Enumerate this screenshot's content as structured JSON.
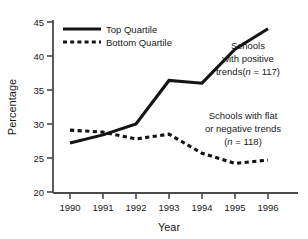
{
  "chart_data": {
    "type": "line",
    "title": "",
    "xlabel": "Year",
    "ylabel": "Percentage",
    "categories": [
      "1990",
      "1991",
      "1992",
      "1993",
      "1994",
      "1995",
      "1996"
    ],
    "x": [
      1990,
      1991,
      1992,
      1993,
      1994,
      1995,
      1996
    ],
    "xlim": [
      1989.5,
      1996.5
    ],
    "ylim": [
      20,
      45
    ],
    "yticks": [
      20,
      25,
      30,
      35,
      40,
      45
    ],
    "xticks": [
      "1990",
      "1991",
      "1992",
      "1993",
      "1994",
      "1995",
      "1996"
    ],
    "grid": false,
    "legend_position": "top-left",
    "series": [
      {
        "name": "Top Quartile",
        "style": "solid",
        "color": "#141414",
        "values": [
          27.2,
          28.4,
          30.0,
          36.4,
          36.0,
          41.0,
          44.0
        ]
      },
      {
        "name": "Bottom Quartile",
        "style": "dashed",
        "color": "#141414",
        "values": [
          29.1,
          28.8,
          27.8,
          28.5,
          25.7,
          24.2,
          24.7
        ]
      }
    ],
    "annotations": [
      {
        "id": "positive-trends",
        "lines": [
          "Schools",
          "with positive",
          "trends(n = 117)"
        ],
        "n_label": "n = 117"
      },
      {
        "id": "flat-negative-trends",
        "lines": [
          "Schools with flat",
          "or negative trends",
          "(n = 118)"
        ],
        "n_label": "n = 118"
      }
    ]
  },
  "axes": {
    "y_title": "Percentage",
    "x_title": "Year",
    "y_tick_labels": [
      "45",
      "40",
      "35",
      "30",
      "25",
      "20"
    ],
    "x_tick_labels": [
      "1990",
      "1991",
      "1992",
      "1993",
      "1994",
      "1995",
      "1996"
    ]
  },
  "legend": {
    "items": [
      {
        "label": "Top Quartile",
        "style": "solid"
      },
      {
        "label": "Bottom Quartile",
        "style": "dashed"
      }
    ]
  },
  "annotation_top": {
    "line1": "Schools",
    "line2": "with positive",
    "line3_pre": "trends(",
    "line3_italic": "n",
    "line3_post": " = 117)"
  },
  "annotation_bottom": {
    "line1": "Schools with flat",
    "line2": "or negative trends",
    "line3_pre": "(",
    "line3_italic": "n",
    "line3_post": " = 118)"
  },
  "colors": {
    "line": "#141414",
    "axis": "#4a4a4a",
    "background": "#ffffff",
    "text": "#1a1a1a"
  }
}
